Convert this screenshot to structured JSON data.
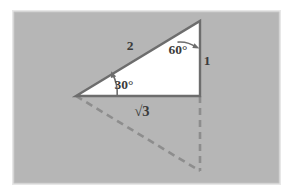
{
  "figure": {
    "panel": {
      "background_color": "#b6b6b6",
      "border_color": "#e9e9e9",
      "page_color": "#ffffff",
      "x": 13,
      "y": 11,
      "width": 267,
      "height": 173
    },
    "colors": {
      "triangle_fill": "#ffffff",
      "stroke": "#6d6d6d",
      "dashed_stroke": "#8d8d8d",
      "label": "#3b3b3b",
      "arc": "#6d6d6d"
    },
    "vertices": {
      "apex": {
        "name": "top-right-vertex",
        "x": 200,
        "y": 21
      },
      "left": {
        "name": "left-vertex",
        "x": 76,
        "y": 96
      },
      "right": {
        "name": "bottom-right-vertex",
        "x": 200,
        "y": 96
      },
      "mirror": {
        "name": "reflected-bottom-vertex",
        "x": 200,
        "y": 171
      }
    },
    "labels": {
      "hypotenuse": "2",
      "vertical_side": "1",
      "base_side": "√3",
      "angle_apex": "60°",
      "angle_left": "30°"
    },
    "label_positions": {
      "hypotenuse": {
        "x": 130,
        "y": 50
      },
      "vertical_side": {
        "x": 207,
        "y": 64
      },
      "base_side": {
        "x": 142,
        "y": 114
      },
      "angle_apex": {
        "x": 178,
        "y": 50
      },
      "angle_left": {
        "x": 121,
        "y": 86
      }
    },
    "dashed_edges": [
      {
        "name": "reflected-hypotenuse",
        "from": "left",
        "to": "mirror"
      },
      {
        "name": "reflected-vertical",
        "from": "right",
        "to": "mirror"
      }
    ],
    "solid_edges": [
      {
        "name": "hypotenuse-edge",
        "from": "left",
        "to": "apex",
        "length_label": "2"
      },
      {
        "name": "vertical-edge",
        "from": "apex",
        "to": "right",
        "length_label": "1"
      },
      {
        "name": "base-edge",
        "from": "right",
        "to": "left",
        "length_label": "√3"
      }
    ]
  }
}
